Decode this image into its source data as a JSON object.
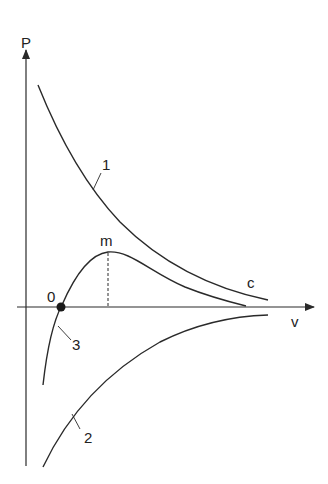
{
  "diagram": {
    "axes": {
      "y_label": "P",
      "x_label": "v"
    },
    "curves": [
      {
        "id": "1",
        "label": "1",
        "description": "decreasing hyperbola-like curve above axis"
      },
      {
        "id": "2",
        "label": "2",
        "description": "increasing curve below axis approaching axis"
      },
      {
        "id": "3",
        "label": "3",
        "description": "curve crossing axis at point 0, rising to maximum m, then falling"
      }
    ],
    "points": {
      "origin_crossing": "0",
      "maximum": "m",
      "convergence": "c"
    },
    "colors": {
      "line": "#2a2a2a",
      "background": "#ffffff"
    }
  }
}
